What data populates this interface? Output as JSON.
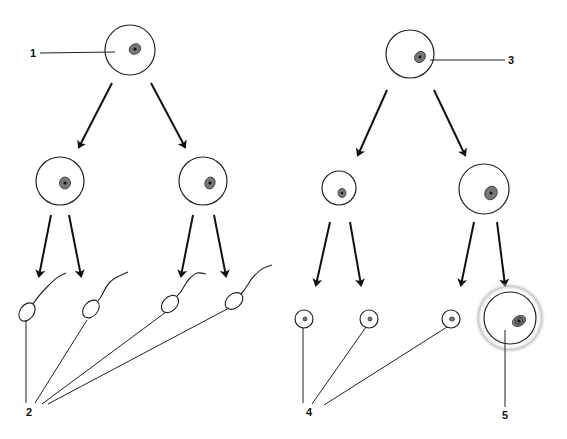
{
  "diagram": {
    "type": "gametogenesis-comparison",
    "panels": [
      {
        "name": "spermatogenesis",
        "side": "left"
      },
      {
        "name": "oogenesis",
        "side": "right"
      }
    ],
    "labels": {
      "l1": "1",
      "l2": "2",
      "l3": "3",
      "l4": "4",
      "l5": "5"
    },
    "colors": {
      "line": "#222222",
      "background": "#ffffff",
      "nucleus": "#777777"
    },
    "structures": {
      "primary_cell_left": "primary spermatocyte",
      "primary_cell_right": "primary oocyte",
      "secondary_cells_left": 2,
      "secondary_cells_right": 2,
      "sperm_count": 4,
      "polar_body_count": 3,
      "ovum_count": 1
    }
  }
}
